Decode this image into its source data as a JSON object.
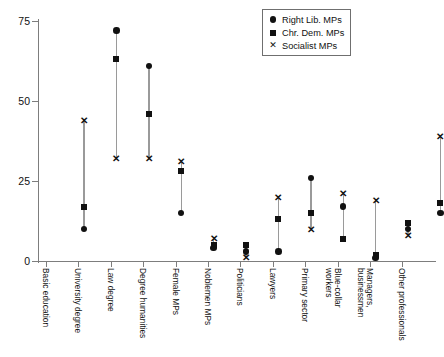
{
  "chart_data": {
    "type": "scatter",
    "title": "",
    "xlabel": "",
    "ylabel": "",
    "ylim": [
      0,
      75
    ],
    "yticks": [
      0,
      25,
      50,
      75
    ],
    "grid": false,
    "legend_position": "top-right",
    "categories": [
      "Basic education",
      "University degree",
      "Law degree",
      "Degree humanities",
      "Female MPs",
      "Noblemen MPs",
      "Politicians",
      "Lawyers",
      "Primary sector",
      "Blue-collar workers",
      "Managers, businessmen",
      "Other professionals"
    ],
    "series": [
      {
        "name": "Right Lib. MPs",
        "marker": "circle",
        "values": [
          10,
          72,
          61,
          15,
          4,
          3,
          3,
          26,
          17,
          1,
          10,
          15
        ]
      },
      {
        "name": "Chr. Dem. MPs",
        "marker": "square",
        "values": [
          17,
          63,
          46,
          28,
          5,
          5,
          13,
          15,
          7,
          2,
          12,
          18
        ]
      },
      {
        "name": "Socialist MPs",
        "marker": "cross",
        "values": [
          44,
          32,
          32,
          31,
          7,
          1,
          20,
          10,
          21,
          19,
          8,
          39
        ]
      }
    ]
  },
  "legend": {
    "entries": [
      {
        "label": "Right Lib. MPs",
        "marker": "circle-marker"
      },
      {
        "label": "Chr. Dem. MPs",
        "marker": "square-marker"
      },
      {
        "label": "Socialist MPs",
        "marker": "cross-marker"
      }
    ]
  },
  "axes": {
    "y_tick_labels": [
      "75",
      "50",
      "25",
      "0"
    ]
  }
}
